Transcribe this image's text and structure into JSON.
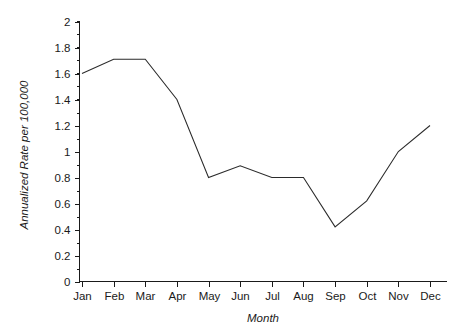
{
  "chart_data": {
    "type": "line",
    "title": "",
    "subtitle": "",
    "xlabel": "Month",
    "ylabel": "Annualized Rate per 100,000",
    "categories": [
      "Jan",
      "Feb",
      "Mar",
      "Apr",
      "May",
      "Jun",
      "Jul",
      "Aug",
      "Sep",
      "Oct",
      "Nov",
      "Dec"
    ],
    "values": [
      1.6,
      1.71,
      1.71,
      1.4,
      0.8,
      0.89,
      0.8,
      0.8,
      0.42,
      0.62,
      1.0,
      1.2
    ],
    "ylim": [
      0,
      2
    ],
    "ytick_labels": [
      "0",
      "0.2",
      "0.4",
      "0.6",
      "0.8",
      "1",
      "1.2",
      "1.4",
      "1.6",
      "1.8",
      "2"
    ],
    "ytick_values": [
      0,
      0.2,
      0.4,
      0.6,
      0.8,
      1,
      1.2,
      1.4,
      1.6,
      1.8,
      2
    ],
    "ytick_minor_step": 0.1,
    "grid": false,
    "legend": false,
    "legend_position": "none",
    "line_color": "#2b2b2b",
    "axis_color": "#1a1a1a",
    "background_color": "#ffffff"
  }
}
